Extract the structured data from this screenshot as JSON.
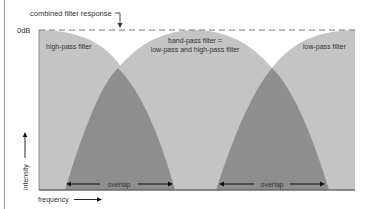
{
  "title_annotation": "combined filter response",
  "y_reference_label": "0dB",
  "filters": {
    "high_pass": "high-pass filter",
    "band_pass_line1": "band-pass filter =",
    "band_pass_line2": "low-pass and high-pass filter",
    "low_pass": "low-pass filter"
  },
  "overlap_labels": [
    "overlap",
    "overlap"
  ],
  "axes": {
    "x_label": "frequency",
    "y_label": "intensity"
  },
  "colors": {
    "filter_fill": "#c4c4c4",
    "overlap_fill": "#8e8e8e",
    "baseline": "#6a6a6a",
    "text": "#333333",
    "dashed_line": "#777777"
  }
}
